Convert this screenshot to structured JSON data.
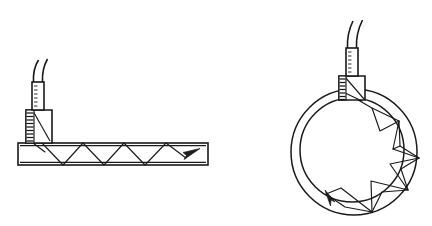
{
  "figure": {
    "background_color": "#ffffff",
    "ink_color": "#1a1a1a",
    "line_art": true,
    "panels": [
      {
        "id": "flat-plate",
        "label": "Angle beam transducer on flat plate",
        "position": "left"
      },
      {
        "id": "pipe-section",
        "label": "Angle beam transducer on pipe cross-section",
        "position": "right"
      }
    ]
  },
  "flat_plate": {
    "name": "test-plate",
    "plate": {
      "x": 18,
      "y": 143,
      "width": 190,
      "height": 22
    },
    "transducer": {
      "name": "angle-beam-transducer",
      "cable": {
        "points": "36,64 33,72 32,82"
      },
      "cable_outer": {
        "points": "43,62 39,71 38,82"
      },
      "connector_body": {
        "x": 32,
        "y": 82,
        "width": 12,
        "height": 28
      },
      "wedge_body": {
        "x": 26,
        "y": 110,
        "width": 26,
        "height": 33
      },
      "damping_face_hatched": true
    },
    "ray_path": {
      "name": "zigzag-skip-path",
      "points": "33,128 42,143 63,165 83,143 104,165 124,143 145,165 166,143 186,158",
      "entry_point": "33,128",
      "skip_count": 4,
      "arrow_tip": {
        "x": 200,
        "y": 149
      },
      "arrow_direction": "up-right"
    }
  },
  "pipe_section": {
    "name": "pipe-cross-section",
    "outer_circle": {
      "cx": 354,
      "cy": 152,
      "r": 63
    },
    "inner_circle": {
      "cx": 352,
      "cy": 150,
      "r": 52
    },
    "transducer": {
      "name": "angle-beam-transducer",
      "cable": {
        "points": "351,22 347,34 346,48"
      },
      "cable_outer": {
        "points": "358,20 354,33 353,48"
      },
      "connector_body": {
        "x": 346,
        "y": 48,
        "width": 12,
        "height": 28
      },
      "wedge_body": {
        "x": 339,
        "y": 76,
        "width": 26,
        "height": 24
      },
      "damping_face_hatched": true
    },
    "ray_path": {
      "name": "circumferential-zigzag-path",
      "entry_point": "346,93",
      "arrow_tip": {
        "x": 326,
        "y": 194
      },
      "arrow_direction": "up-left"
    }
  }
}
